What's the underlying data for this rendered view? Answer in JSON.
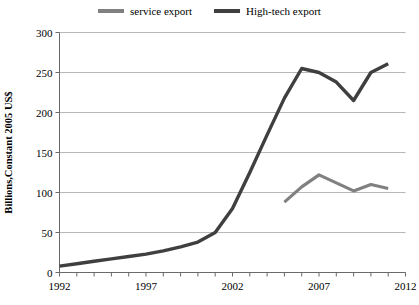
{
  "chart_data": {
    "type": "line",
    "title": "",
    "xlabel": "",
    "ylabel": "Billions,Constant 2005 US$",
    "xlim": [
      1992,
      2012
    ],
    "ylim": [
      0,
      300
    ],
    "yticks": [
      0,
      50,
      100,
      150,
      200,
      250,
      300
    ],
    "xticks": [
      1992,
      1997,
      2002,
      2007,
      2012
    ],
    "xtick_labels": [
      "1992",
      "1997",
      "2002",
      "2007",
      "2012"
    ],
    "ytick_labels": [
      "0",
      "50",
      "100",
      "150",
      "200",
      "250",
      "300"
    ],
    "grid": true,
    "legend_position": "top-center",
    "x": [
      1992,
      1993,
      1994,
      1995,
      1996,
      1997,
      1998,
      1999,
      2000,
      2001,
      2002,
      2003,
      2004,
      2005,
      2006,
      2007,
      2008,
      2009,
      2010,
      2011
    ],
    "series": [
      {
        "name": "service export",
        "color": "#808080",
        "x": [
          2005,
          2006,
          2007,
          2008,
          2009,
          2010,
          2011
        ],
        "values": [
          88,
          107,
          122,
          112,
          102,
          110,
          105
        ]
      },
      {
        "name": "High-tech export",
        "color": "#3f3f3f",
        "x": [
          1992,
          1993,
          1994,
          1995,
          1996,
          1997,
          1998,
          1999,
          2000,
          2001,
          2002,
          2003,
          2004,
          2005,
          2006,
          2007,
          2008,
          2009,
          2010,
          2011
        ],
        "values": [
          8,
          11,
          14,
          17,
          20,
          23,
          27,
          32,
          38,
          50,
          80,
          125,
          172,
          218,
          255,
          250,
          238,
          215,
          250,
          261
        ]
      }
    ]
  },
  "legend": {
    "entries": [
      {
        "label": "service export",
        "color": "#808080"
      },
      {
        "label": "High-tech export",
        "color": "#3f3f3f"
      }
    ]
  },
  "axes": {
    "y_axis_title": "Billions,Constant 2005 US$"
  }
}
